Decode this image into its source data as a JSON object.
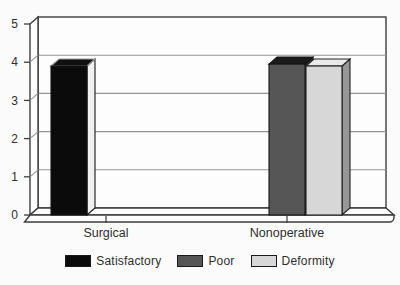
{
  "figure": {
    "background": "#fbfbfb",
    "text_color": "#2e2e2e",
    "wall_fill": "#fdfdfd",
    "wall_stroke": "#3c3c3c",
    "gridline_color": "#949494"
  },
  "chart_data": {
    "type": "bar",
    "style": "3d-column",
    "title": "",
    "xlabel": "",
    "ylabel": "",
    "categories": [
      "Surgical",
      "Nonoperative"
    ],
    "series": [
      {
        "name": "Satisfactory",
        "values": [
          3.9,
          0
        ],
        "front_color": "#0b0b0b",
        "top_color": "#101010",
        "side_color": "#f0f0f0",
        "edge_color": "#161616",
        "top_edge_color": "#9a9a9a"
      },
      {
        "name": "Poor",
        "values": [
          0,
          3.95
        ],
        "front_color": "#565656",
        "top_color": "#1b1b1b",
        "side_color": "#2f2f2f",
        "edge_color": "#161616",
        "top_edge_color": "#161616"
      },
      {
        "name": "Deformity",
        "values": [
          0,
          3.9
        ],
        "front_color": "#d7d7d7",
        "top_color": "#eaeaea",
        "side_color": "#979797",
        "edge_color": "#222222",
        "top_edge_color": "#222222"
      }
    ],
    "ylim": [
      0,
      5
    ],
    "yticks": [
      "0",
      "1",
      "2",
      "3",
      "4",
      "5"
    ],
    "grid": true,
    "legend_position": "bottom"
  }
}
